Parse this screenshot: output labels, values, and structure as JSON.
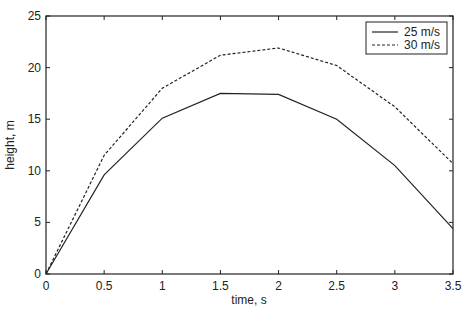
{
  "chart_data": {
    "type": "line",
    "title": "",
    "xlabel": "time, s",
    "ylabel": "height, m",
    "xlim": [
      0,
      3.5
    ],
    "ylim": [
      0,
      25
    ],
    "x_ticks": [
      "0",
      "0.5",
      "1",
      "1.5",
      "2",
      "2.5",
      "3",
      "3.5"
    ],
    "y_ticks": [
      "0",
      "5",
      "10",
      "15",
      "20",
      "25"
    ],
    "grid": false,
    "legend_position": "upper right",
    "x": [
      0,
      0.5,
      1,
      1.5,
      2,
      2.5,
      3,
      3.5
    ],
    "series": [
      {
        "name": "25 m/s",
        "style": "solid",
        "values": [
          0,
          9.6,
          15.1,
          17.5,
          17.4,
          15.0,
          10.5,
          4.4
        ]
      },
      {
        "name": "30 m/s",
        "style": "dashed",
        "values": [
          0,
          11.5,
          18.0,
          21.2,
          21.9,
          20.2,
          16.2,
          10.7
        ]
      }
    ]
  }
}
